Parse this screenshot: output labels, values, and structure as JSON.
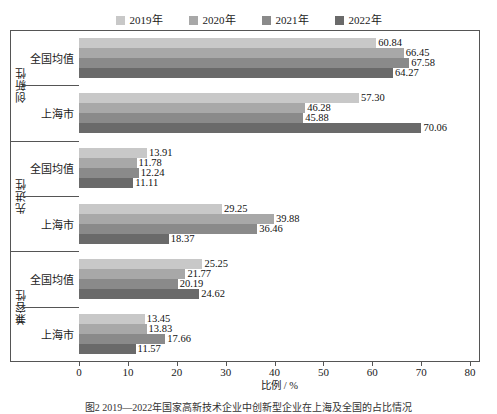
{
  "chart_data": {
    "type": "bar",
    "orientation": "horizontal",
    "title": "",
    "xlabel": "比例 / %",
    "ylabel": "",
    "xlim": [
      0,
      80
    ],
    "xticks": [
      0,
      10,
      20,
      30,
      40,
      50,
      60,
      70,
      80
    ],
    "grid": false,
    "legend_position": "top-center",
    "series": [
      {
        "name": "2019年",
        "color": "#c8c8c8"
      },
      {
        "name": "2020年",
        "color": "#a8a8a8"
      },
      {
        "name": "2021年",
        "color": "#8a8a8a"
      },
      {
        "name": "2022年",
        "color": "#6a6a6a"
      }
    ],
    "groups": [
      {
        "label": "创新性",
        "rows": [
          {
            "label": "全国均值",
            "values": [
              60.84,
              66.45,
              67.58,
              64.27
            ]
          },
          {
            "label": "上海市",
            "values": [
              57.3,
              46.28,
              45.88,
              70.06
            ]
          }
        ]
      },
      {
        "label": "先进性",
        "rows": [
          {
            "label": "全国均值",
            "values": [
              13.91,
              11.78,
              12.24,
              11.11
            ]
          },
          {
            "label": "上海市",
            "values": [
              29.25,
              39.88,
              36.46,
              18.37
            ]
          }
        ]
      },
      {
        "label": "兼容性",
        "rows": [
          {
            "label": "全国均值",
            "values": [
              25.25,
              21.77,
              20.19,
              24.62
            ]
          },
          {
            "label": "上海市",
            "values": [
              13.45,
              13.83,
              17.66,
              11.57
            ]
          }
        ]
      }
    ]
  },
  "legend": {
    "items": [
      {
        "label": "2019年",
        "color": "#c8c8c8"
      },
      {
        "label": "2020年",
        "color": "#a8a8a8"
      },
      {
        "label": "2021年",
        "color": "#8a8a8a"
      },
      {
        "label": "2022年",
        "color": "#6a6a6a"
      }
    ]
  },
  "axis": {
    "x_title": "比例 / %",
    "ticks": [
      "0",
      "10",
      "20",
      "30",
      "40",
      "50",
      "60",
      "70",
      "80"
    ]
  },
  "caption": "图2  2019—2022年国家高新技术企业中创新型企业在上海及全国的占比情况"
}
